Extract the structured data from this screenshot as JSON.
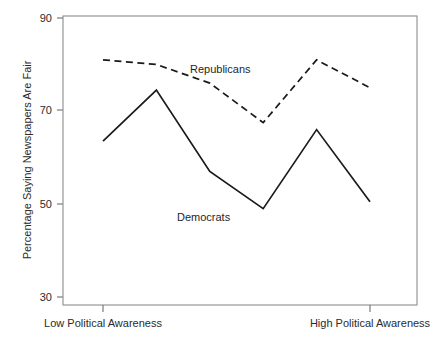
{
  "chart_data": {
    "type": "line",
    "title": "",
    "xlabel": "",
    "ylabel": "Percentage Saying Newspapers Are Fair",
    "ylim": [
      30,
      90
    ],
    "yticks": [
      30,
      50,
      70,
      90
    ],
    "ytick_labels": [
      "30",
      "50",
      "70",
      "90"
    ],
    "xlim": [
      0,
      7
    ],
    "xticks": [
      1,
      6
    ],
    "xtick_labels": [
      "Low Political Awareness",
      "High Political Awareness"
    ],
    "x": [
      1,
      2,
      3,
      4,
      5,
      6
    ],
    "grid": false,
    "legend": "inline-annotations",
    "series": [
      {
        "name": "Republicans",
        "style": "dashed",
        "values": [
          81,
          80,
          76,
          67.5,
          81,
          75
        ]
      },
      {
        "name": "Democrats",
        "style": "solid",
        "values": [
          63.5,
          74.5,
          57,
          49,
          66,
          50.5
        ]
      }
    ],
    "annotations": [
      {
        "text": "Republicans",
        "x": 3.1,
        "y": 80.5
      },
      {
        "text": "Democrats",
        "x": 3.0,
        "y": 52.5
      }
    ]
  }
}
